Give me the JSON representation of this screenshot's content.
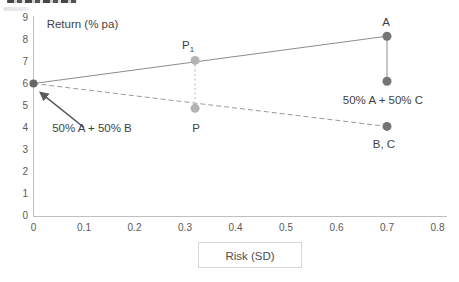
{
  "chart_data": {
    "type": "scatter",
    "title": "",
    "ylabel": "Return (% pa)",
    "xlabel": "Risk (SD)",
    "xlim": [
      0,
      0.8
    ],
    "ylim": [
      0,
      9
    ],
    "grid": false,
    "axis_color": "#bfbfbf",
    "tick_label_color": "#595959",
    "annotation_color": "#3f3f3f",
    "x_ticks": [
      0,
      0.1,
      0.2,
      0.3,
      0.4,
      0.5,
      0.6,
      0.7,
      0.8
    ],
    "x_tick_labels": [
      "0",
      "0.1",
      "0.2",
      "0.3",
      "0.4",
      "0.5",
      "0.6",
      "0.7",
      "0.8"
    ],
    "y_ticks": [
      0,
      1,
      2,
      3,
      4,
      5,
      6,
      7,
      8,
      9
    ],
    "y_tick_labels": [
      "0",
      "1",
      "2",
      "3",
      "4",
      "5",
      "6",
      "7",
      "8",
      "9"
    ],
    "points": [
      {
        "name": "A",
        "x": 0.7,
        "y": 8.15,
        "color": "#757575",
        "r": 4.5
      },
      {
        "name": "50pctA-50pctC",
        "x": 0.7,
        "y": 6.1,
        "color": "#757575",
        "r": 4.5
      },
      {
        "name": "B-C",
        "x": 0.7,
        "y": 4.05,
        "color": "#757575",
        "r": 4.5
      },
      {
        "name": "50pctA-50pctB",
        "x": 0.0,
        "y": 6.0,
        "color": "#666666",
        "r": 4
      },
      {
        "name": "P1",
        "x": 0.32,
        "y": 7.05,
        "color": "#b3b3b3",
        "r": 4.5
      },
      {
        "name": "P",
        "x": 0.32,
        "y": 4.87,
        "color": "#b3b3b3",
        "r": 4.5
      }
    ],
    "lines": [
      {
        "name": "line-AB-to-A",
        "from": [
          0.0,
          6.0
        ],
        "to": [
          0.7,
          8.15
        ],
        "style": "solid",
        "color": "#8c8c8c",
        "width": 1
      },
      {
        "name": "line-A-to-AC",
        "from": [
          0.7,
          8.15
        ],
        "to": [
          0.7,
          6.1
        ],
        "style": "solid",
        "color": "#8c8c8c",
        "width": 1
      },
      {
        "name": "line-AB-to-BC",
        "from": [
          0.0,
          6.0
        ],
        "to": [
          0.7,
          4.05
        ],
        "style": "dashed",
        "color": "#9a9a9a",
        "width": 1
      },
      {
        "name": "line-P1-to-P",
        "from": [
          0.32,
          7.05
        ],
        "to": [
          0.32,
          4.87
        ],
        "style": "dotted",
        "color": "#cfcfcf",
        "width": 1.6
      }
    ],
    "arrow": {
      "name": "arrow-to-50pctA-50pctB",
      "from": [
        0.1,
        4.0
      ],
      "to": [
        0.013,
        5.6
      ],
      "color": "#595959",
      "width": 1.6
    },
    "annotations": [
      {
        "name": "ylabel-inside",
        "text": "Return (% pa)",
        "x": 0.026,
        "y": 8.52,
        "anchor": "start",
        "size": 11.5
      },
      {
        "name": "label-A",
        "text": "A",
        "x": 0.698,
        "y": 8.62,
        "anchor": "middle",
        "size": 11.5
      },
      {
        "name": "label-P1",
        "text": "P",
        "sub": "1",
        "x": 0.306,
        "y": 7.55,
        "anchor": "middle",
        "size": 11.5
      },
      {
        "name": "label-P",
        "text": "P",
        "x": 0.322,
        "y": 3.78,
        "anchor": "middle",
        "size": 11.5
      },
      {
        "name": "label-B-C",
        "text": "B, C",
        "x": 0.694,
        "y": 3.05,
        "anchor": "middle",
        "size": 11.5
      },
      {
        "name": "label-AC",
        "text": "50% A + 50% C",
        "x": 0.692,
        "y": 5.08,
        "anchor": "middle",
        "size": 11.5
      },
      {
        "name": "label-AB",
        "text": "50% A + 50% B",
        "x": 0.037,
        "y": 3.78,
        "anchor": "start",
        "size": 11.5
      }
    ]
  }
}
